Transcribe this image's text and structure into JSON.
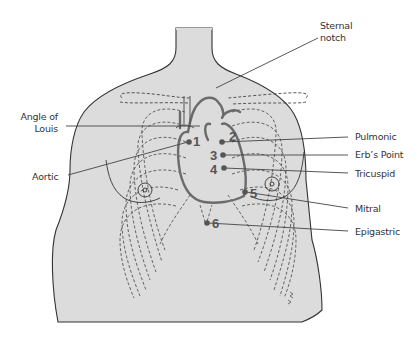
{
  "diagram": {
    "colors": {
      "skin_fill": "#dcdcdc",
      "outline": "#333333",
      "heart": "#6b6b6b",
      "leader_line": "#444444",
      "label_text": "#333333"
    },
    "labels": {
      "sternal_notch_line1": "Sternal",
      "sternal_notch_line2": "notch",
      "angle_of_louis_line1": "Angle of",
      "angle_of_louis_line2": "Louis",
      "aortic": "Aortic",
      "pulmonic": "Pulmonic",
      "erbs_point": "Erb’s Point",
      "tricuspid": "Tricuspid",
      "mitral": "Mitral",
      "epigastric": "Epigastric"
    },
    "points": [
      {
        "number": "1",
        "name": "Aortic"
      },
      {
        "number": "2",
        "name": "Pulmonic"
      },
      {
        "number": "3",
        "name": "Erb’s Point"
      },
      {
        "number": "4",
        "name": "Tricuspid"
      },
      {
        "number": "5",
        "name": "Mitral"
      },
      {
        "number": "6",
        "name": "Epigastric"
      }
    ]
  }
}
